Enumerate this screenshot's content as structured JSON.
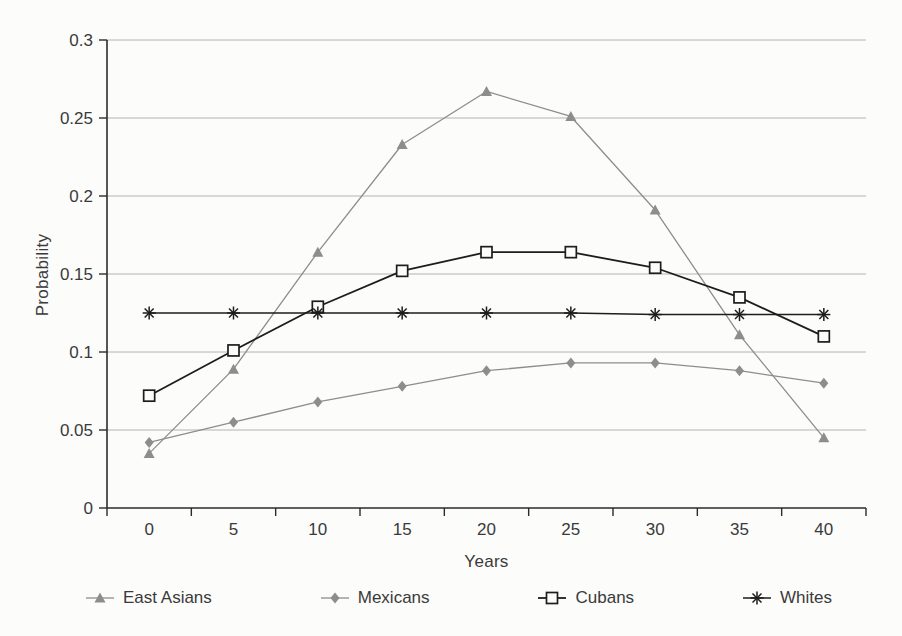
{
  "chart_data": {
    "type": "line",
    "title": "",
    "xlabel": "Years",
    "ylabel": "Probability",
    "categories": [
      "0",
      "5",
      "10",
      "15",
      "20",
      "25",
      "30",
      "35",
      "40"
    ],
    "ylim": [
      0,
      0.3
    ],
    "ytick_step": 0.05,
    "ytick_labels": [
      "0",
      "0.05",
      "0.1",
      "0.15",
      "0.2",
      "0.25",
      "0.3"
    ],
    "grid": true,
    "legend_position": "bottom",
    "axis_color": "#2b2b2b",
    "gridline_color": "#ababab",
    "series": [
      {
        "name": "East Asians",
        "marker": "triangle",
        "color": "#8d8d8d",
        "line_width": 1.3,
        "values": [
          0.035,
          0.089,
          0.164,
          0.233,
          0.267,
          0.251,
          0.191,
          0.111,
          0.045
        ]
      },
      {
        "name": "Mexicans",
        "marker": "diamond",
        "color": "#8d8d8d",
        "line_width": 1.3,
        "values": [
          0.042,
          0.055,
          0.068,
          0.078,
          0.088,
          0.093,
          0.093,
          0.088,
          0.08
        ]
      },
      {
        "name": "Cubans",
        "marker": "open-square",
        "color": "#1d1d1d",
        "line_width": 1.8,
        "values": [
          0.072,
          0.101,
          0.129,
          0.152,
          0.164,
          0.164,
          0.154,
          0.135,
          0.11
        ]
      },
      {
        "name": "Whites",
        "marker": "asterisk",
        "color": "#1d1d1d",
        "line_width": 1.5,
        "values": [
          0.125,
          0.125,
          0.125,
          0.125,
          0.125,
          0.125,
          0.124,
          0.124,
          0.124
        ]
      }
    ]
  }
}
